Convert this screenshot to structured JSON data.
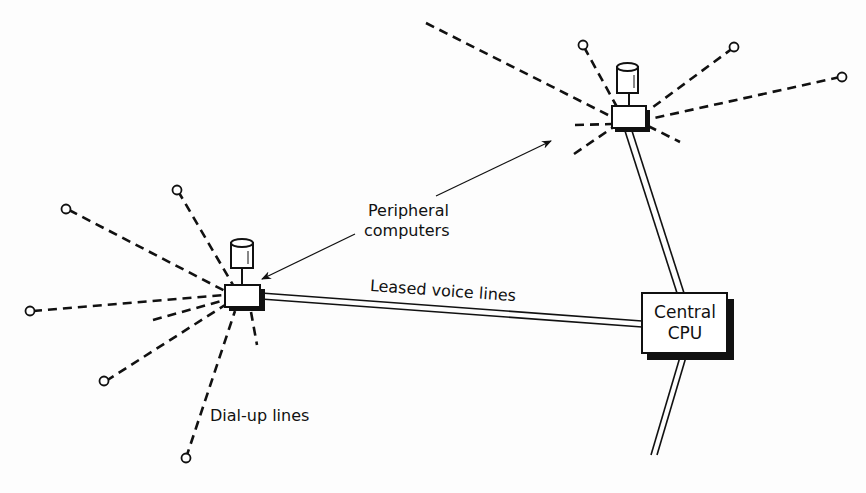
{
  "diagram": {
    "type": "network-topology",
    "labels": {
      "peripheral": [
        "Peripheral",
        "computers"
      ],
      "leased": "Leased voice lines",
      "dialup": "Dial-up lines",
      "cpu": [
        "Central",
        "CPU"
      ]
    },
    "nodes": [
      {
        "id": "central-cpu",
        "kind": "central-computer",
        "label": "Central CPU"
      },
      {
        "id": "peripheral-upper",
        "kind": "peripheral-computer-with-disk"
      },
      {
        "id": "peripheral-lower",
        "kind": "peripheral-computer-with-disk"
      }
    ],
    "edges": [
      {
        "from": "peripheral-lower",
        "to": "central-cpu",
        "style": "double-line",
        "label": "Leased voice lines"
      },
      {
        "from": "peripheral-upper",
        "to": "central-cpu",
        "style": "double-line"
      },
      {
        "from": "central-cpu",
        "to": "offscreen-bottom",
        "style": "double-line"
      }
    ],
    "dialup_lines_style": "dashed",
    "terminal_symbol": "small-circle",
    "colors": {
      "ink": "#111111",
      "background": "#fdfdfd"
    }
  }
}
